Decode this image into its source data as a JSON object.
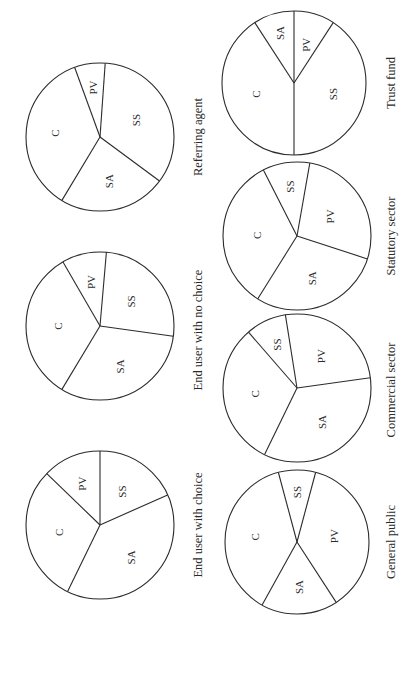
{
  "figure": {
    "orientation": "rotated 90 degrees counter-clockwise",
    "legend_codes": [
      "C",
      "PV",
      "SS",
      "SA"
    ]
  },
  "chart_data": {
    "type": "pie",
    "title": "",
    "units": "approximate share of pie (%)",
    "charts": [
      {
        "name": "End user with choice",
        "slices": [
          {
            "label": "C",
            "value": 30
          },
          {
            "label": "PV",
            "value": 13
          },
          {
            "label": "SS",
            "value": 18
          },
          {
            "label": "SA",
            "value": 39
          }
        ]
      },
      {
        "name": "End user with no choice",
        "slices": [
          {
            "label": "C",
            "value": 33
          },
          {
            "label": "PV",
            "value": 10
          },
          {
            "label": "SS",
            "value": 26
          },
          {
            "label": "SA",
            "value": 31
          }
        ]
      },
      {
        "name": "Referring agent",
        "slices": [
          {
            "label": "C",
            "value": 36
          },
          {
            "label": "PV",
            "value": 7
          },
          {
            "label": "SS",
            "value": 34
          },
          {
            "label": "SA",
            "value": 23
          }
        ]
      },
      {
        "name": "General public",
        "slices": [
          {
            "label": "C",
            "value": 38
          },
          {
            "label": "SS",
            "value": 8
          },
          {
            "label": "PV",
            "value": 37
          },
          {
            "label": "SA",
            "value": 17
          }
        ]
      },
      {
        "name": "Commercial sector",
        "slices": [
          {
            "label": "C",
            "value": 31
          },
          {
            "label": "SS",
            "value": 9
          },
          {
            "label": "PV",
            "value": 25
          },
          {
            "label": "SA",
            "value": 35
          }
        ]
      },
      {
        "name": "Statutory sector",
        "slices": [
          {
            "label": "C",
            "value": 34
          },
          {
            "label": "SS",
            "value": 10
          },
          {
            "label": "PV",
            "value": 27
          },
          {
            "label": "SA",
            "value": 29
          }
        ]
      },
      {
        "name": "Trust fund",
        "slices": [
          {
            "label": "C",
            "value": 41
          },
          {
            "label": "SA",
            "value": 9
          },
          {
            "label": "PV",
            "value": 9
          },
          {
            "label": "SS",
            "value": 41
          }
        ]
      }
    ]
  },
  "render": {
    "pies": [
      {
        "caption": "Referring agent",
        "cx": 100,
        "cy": 137,
        "r": 74,
        "cap_x": 198,
        "cap_y": 137,
        "boundaries": [
          -110,
          -86,
          36.5,
          121
        ],
        "labels": [
          {
            "text": "PV",
            "angle": -98,
            "dist": 50
          },
          {
            "text": "SS",
            "angle": -25,
            "dist": 40
          },
          {
            "text": "SA",
            "angle": 79,
            "dist": 45
          },
          {
            "text": "C",
            "angle": 185,
            "dist": 45
          }
        ]
      },
      {
        "caption": "End user with no choice",
        "cx": 100,
        "cy": 326,
        "r": 74,
        "cap_x": 198,
        "cap_y": 330,
        "boundaries": [
          -120,
          -85,
          8,
          121
        ],
        "labels": [
          {
            "text": "PV",
            "angle": -102,
            "dist": 45
          },
          {
            "text": "SS",
            "angle": -38,
            "dist": 40
          },
          {
            "text": "SA",
            "angle": 64,
            "dist": 45
          },
          {
            "text": "C",
            "angle": 180,
            "dist": 42
          }
        ]
      },
      {
        "caption": "End user with choice",
        "cx": 100,
        "cy": 525,
        "r": 74,
        "cap_x": 198,
        "cap_y": 525,
        "boundaries": [
          -136,
          -90,
          -24,
          116
        ],
        "labels": [
          {
            "text": "PV",
            "angle": -113,
            "dist": 45
          },
          {
            "text": "SS",
            "angle": -57,
            "dist": 40
          },
          {
            "text": "SA",
            "angle": 46,
            "dist": 45
          },
          {
            "text": "C",
            "angle": 170,
            "dist": 42
          }
        ]
      },
      {
        "caption": "Trust fund",
        "cx": 294,
        "cy": 83,
        "r": 72,
        "cap_x": 391,
        "cap_y": 83,
        "boundaries": [
          -123,
          -90,
          -57,
          90
        ],
        "labels": [
          {
            "text": "SA",
            "angle": -106,
            "dist": 52
          },
          {
            "text": "PV",
            "angle": -73,
            "dist": 40
          },
          {
            "text": "SS",
            "angle": 16,
            "dist": 40
          },
          {
            "text": "C",
            "angle": 164,
            "dist": 40
          }
        ]
      },
      {
        "caption": "Statutory sector",
        "cx": 297,
        "cy": 236,
        "r": 74,
        "cap_x": 391,
        "cap_y": 236,
        "boundaries": [
          -117,
          -80,
          18,
          122
        ],
        "labels": [
          {
            "text": "SS",
            "angle": -98,
            "dist": 50
          },
          {
            "text": "PV",
            "angle": -31,
            "dist": 38
          },
          {
            "text": "SA",
            "angle": 70,
            "dist": 45
          },
          {
            "text": "C",
            "angle": 181,
            "dist": 40
          }
        ]
      },
      {
        "caption": "Commercial sector",
        "cx": 297,
        "cy": 388,
        "r": 74,
        "cap_x": 391,
        "cap_y": 390,
        "boundaries": [
          -131,
          -99,
          -8,
          116
        ],
        "labels": [
          {
            "text": "SS",
            "angle": -115,
            "dist": 48
          },
          {
            "text": "PV",
            "angle": -53,
            "dist": 40
          },
          {
            "text": "SA",
            "angle": 54,
            "dist": 42
          },
          {
            "text": "C",
            "angle": 172,
            "dist": 42
          }
        ]
      },
      {
        "caption": "General public",
        "cx": 297,
        "cy": 542,
        "r": 72,
        "cap_x": 391,
        "cap_y": 542,
        "boundaries": [
          -105,
          -75,
          57,
          119
        ],
        "labels": [
          {
            "text": "SS",
            "angle": -90,
            "dist": 50
          },
          {
            "text": "PV",
            "angle": -9,
            "dist": 38
          },
          {
            "text": "SA",
            "angle": 88,
            "dist": 45
          },
          {
            "text": "C",
            "angle": 187,
            "dist": 42
          }
        ]
      }
    ]
  }
}
